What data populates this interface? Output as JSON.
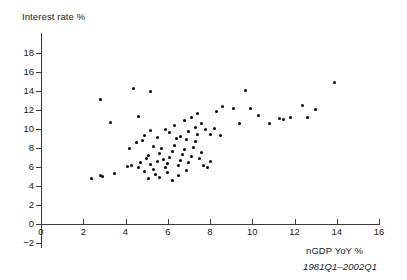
{
  "chart_data": {
    "type": "scatter",
    "title": "",
    "xlabel": "nGDP YoY %",
    "ylabel": "Interest rate %",
    "caption": "1981Q1–2002Q1",
    "xlim": [
      0,
      16
    ],
    "ylim": [
      -2,
      18
    ],
    "xticks": [
      0,
      2,
      4,
      6,
      8,
      10,
      12,
      14,
      16
    ],
    "yticks": [
      -2,
      0,
      2,
      4,
      6,
      8,
      10,
      12,
      14,
      16,
      18
    ],
    "grid": false,
    "legend": false,
    "marker": "filled-circle",
    "marker_color": "#000000",
    "n_points": 85,
    "points": [
      [
        2.4,
        4.8
      ],
      [
        2.8,
        5.1
      ],
      [
        2.9,
        5.0
      ],
      [
        3.5,
        5.3
      ],
      [
        2.8,
        13.1
      ],
      [
        4.4,
        14.3
      ],
      [
        5.2,
        14.0
      ],
      [
        3.3,
        10.7
      ],
      [
        4.6,
        11.3
      ],
      [
        4.1,
        6.1
      ],
      [
        4.3,
        6.2
      ],
      [
        4.6,
        6.0
      ],
      [
        4.7,
        6.5
      ],
      [
        4.2,
        7.9
      ],
      [
        4.5,
        8.6
      ],
      [
        4.8,
        8.8
      ],
      [
        4.9,
        9.3
      ],
      [
        5.0,
        6.9
      ],
      [
        5.1,
        7.2
      ],
      [
        5.2,
        6.3
      ],
      [
        5.3,
        5.7
      ],
      [
        5.4,
        5.2
      ],
      [
        5.5,
        6.6
      ],
      [
        5.6,
        7.4
      ],
      [
        5.7,
        8.0
      ],
      [
        5.8,
        6.8
      ],
      [
        5.9,
        5.9
      ],
      [
        6.0,
        5.4
      ],
      [
        6.0,
        6.4
      ],
      [
        6.1,
        7.0
      ],
      [
        6.2,
        7.6
      ],
      [
        6.3,
        8.3
      ],
      [
        6.4,
        9.0
      ],
      [
        6.5,
        6.2
      ],
      [
        6.6,
        6.7
      ],
      [
        6.7,
        7.3
      ],
      [
        6.8,
        7.8
      ],
      [
        6.9,
        5.6
      ],
      [
        7.0,
        6.5
      ],
      [
        7.1,
        7.1
      ],
      [
        7.2,
        8.1
      ],
      [
        7.3,
        8.7
      ],
      [
        7.4,
        9.4
      ],
      [
        7.5,
        6.9
      ],
      [
        7.6,
        7.5
      ],
      [
        5.1,
        4.8
      ],
      [
        5.6,
        4.9
      ],
      [
        6.2,
        4.6
      ],
      [
        6.5,
        5.1
      ],
      [
        4.9,
        5.5
      ],
      [
        5.3,
        8.2
      ],
      [
        5.5,
        9.1
      ],
      [
        6.1,
        9.6
      ],
      [
        6.6,
        9.2
      ],
      [
        6.9,
        8.9
      ],
      [
        7.0,
        9.7
      ],
      [
        7.3,
        10.2
      ],
      [
        7.6,
        10.6
      ],
      [
        7.8,
        9.9
      ],
      [
        8.0,
        9.4
      ],
      [
        8.2,
        10.1
      ],
      [
        8.5,
        9.3
      ],
      [
        8.0,
        6.6
      ],
      [
        7.9,
        5.9
      ],
      [
        7.7,
        6.2
      ],
      [
        6.8,
        10.9
      ],
      [
        7.1,
        11.2
      ],
      [
        7.4,
        11.6
      ],
      [
        6.3,
        10.4
      ],
      [
        5.9,
        10.0
      ],
      [
        5.2,
        9.8
      ],
      [
        8.3,
        11.9
      ],
      [
        8.6,
        12.4
      ],
      [
        9.7,
        14.1
      ],
      [
        9.9,
        12.2
      ],
      [
        10.3,
        11.4
      ],
      [
        10.8,
        10.6
      ],
      [
        11.3,
        11.1
      ],
      [
        11.5,
        11.0
      ],
      [
        11.8,
        11.2
      ],
      [
        12.4,
        12.5
      ],
      [
        12.6,
        11.2
      ],
      [
        13.0,
        12.1
      ],
      [
        13.9,
        14.9
      ],
      [
        9.4,
        10.6
      ],
      [
        9.1,
        12.2
      ]
    ]
  }
}
